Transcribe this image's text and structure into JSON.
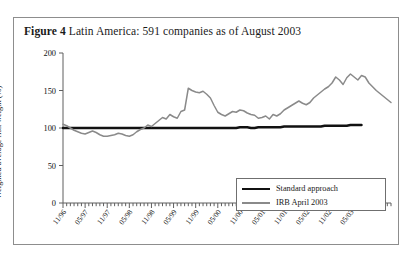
{
  "figure": {
    "number_label": "Figure 4",
    "caption": "Latin America: 591 companies as of August 2003"
  },
  "chart_data": {
    "type": "line",
    "title": "Latin America: 591 companies as of August 2003",
    "xlabel": "",
    "ylabel": "Weighted average risk weight (%)",
    "ylim": [
      0,
      200
    ],
    "yticks": [
      0,
      50,
      100,
      150,
      200
    ],
    "ytick_labels": [
      "0",
      "50",
      "100",
      "150",
      "200"
    ],
    "grid": false,
    "legend_position": "bottom-right",
    "x_major_labels": [
      "11/96",
      "05/97",
      "11/97",
      "05/98",
      "11/98",
      "05/99",
      "11/99",
      "05/00",
      "11/00",
      "05/01",
      "11/01",
      "05/02",
      "11/02",
      "05/03"
    ],
    "x_minor_tick_interval_months": 1,
    "x_major_tick_interval_months": 6,
    "x_start": "11/96",
    "x_end": "08/03",
    "colors": {
      "standard_approach": "#111111",
      "irb_april_2003": "#8a8a8a",
      "frame": "#8d8d8d"
    },
    "series": [
      {
        "name": "Standard approach",
        "color": "#111111",
        "values": [
          100,
          100,
          100,
          100,
          100,
          100,
          100,
          100,
          100,
          100,
          100,
          100,
          100,
          100,
          100,
          100,
          100,
          100,
          100,
          100,
          100,
          100,
          100,
          100,
          100,
          100,
          100,
          100,
          100,
          100,
          100,
          100,
          100,
          100,
          100,
          100,
          100,
          100,
          100,
          100,
          100,
          100,
          100,
          100,
          100,
          100,
          100,
          100,
          101,
          101,
          101,
          100,
          100,
          101,
          101,
          101,
          101,
          101,
          101,
          101,
          102,
          102,
          102,
          102,
          102,
          102,
          102,
          102,
          102,
          102,
          102,
          103,
          103,
          103,
          103,
          103,
          103,
          103,
          104,
          104,
          104,
          104
        ]
      },
      {
        "name": "IRB April 2003",
        "color": "#8a8a8a",
        "values": [
          105,
          103,
          100,
          97,
          95,
          93,
          92,
          94,
          96,
          94,
          91,
          89,
          89,
          90,
          91,
          93,
          92,
          90,
          89,
          91,
          95,
          98,
          100,
          104,
          102,
          106,
          110,
          114,
          112,
          118,
          115,
          113,
          122,
          124,
          153,
          150,
          148,
          147,
          149,
          145,
          140,
          130,
          121,
          118,
          116,
          119,
          122,
          121,
          124,
          123,
          120,
          118,
          117,
          113,
          114,
          116,
          112,
          118,
          116,
          119,
          124,
          127,
          130,
          133,
          136,
          133,
          131,
          134,
          140,
          144,
          148,
          152,
          155,
          160,
          168,
          164,
          158,
          167,
          172,
          168,
          164,
          170,
          168,
          160,
          155,
          150,
          146,
          142,
          138,
          134
        ]
      }
    ]
  },
  "legend": {
    "items": [
      {
        "label": "Standard approach",
        "style": "black-line"
      },
      {
        "label": "IRB April 2003",
        "style": "gray-line"
      }
    ]
  }
}
